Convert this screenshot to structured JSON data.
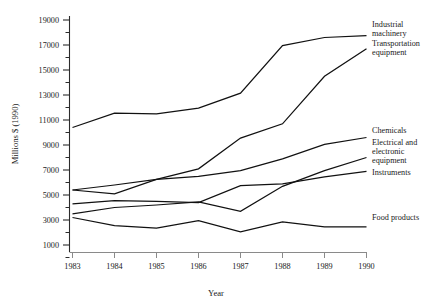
{
  "chart_data": {
    "type": "line",
    "title": "",
    "xlabel": "Year",
    "ylabel": "Millions $ (1990)",
    "x": [
      1983,
      1984,
      1985,
      1986,
      1987,
      1988,
      1989,
      1990
    ],
    "xtick_labels": [
      "1983",
      "1984",
      "1985",
      "1986",
      "1987",
      "1988",
      "1989",
      "1990"
    ],
    "ytick_labels": [
      "1000",
      "3000",
      "5000",
      "7000",
      "9000",
      "11000",
      "13000",
      "15000",
      "17000",
      "19000"
    ],
    "ytick_values": [
      1000,
      3000,
      5000,
      7000,
      9000,
      11000,
      13000,
      15000,
      17000,
      19000
    ],
    "ylim": [
      0,
      19800
    ],
    "xlim": [
      1983,
      1990
    ],
    "minor_ticks": true,
    "grid": false,
    "legend_position": "right-inline-labels",
    "series": [
      {
        "name": "Industrial machinery",
        "label": "Industrial machinery",
        "label_lines": [
          "Industrial",
          "machinery"
        ],
        "values": [
          10400,
          11550,
          11500,
          11950,
          13150,
          16950,
          17600,
          17750
        ]
      },
      {
        "name": "Transportation equipment",
        "label": "Transportation equipment",
        "label_lines": [
          "Transportation",
          "equipment"
        ],
        "values": [
          5400,
          5100,
          6250,
          7100,
          9550,
          10700,
          14500,
          16700
        ]
      },
      {
        "name": "Chemicals",
        "label": "Chemicals",
        "label_lines": [
          "Chemicals"
        ],
        "values": [
          5400,
          5800,
          6250,
          6500,
          6950,
          7900,
          9050,
          9600
        ]
      },
      {
        "name": "Electrical and electronic equipment",
        "label": "Electrical and electronic equipment",
        "label_lines": [
          "Electrical and",
          "electronic",
          "equipment"
        ],
        "values": [
          3500,
          4000,
          4200,
          4450,
          3700,
          5700,
          6950,
          8000
        ]
      },
      {
        "name": "Instruments",
        "label": "Instruments",
        "label_lines": [
          "Instruments"
        ],
        "values": [
          4300,
          4550,
          4500,
          4400,
          5750,
          5900,
          6450,
          6900
        ]
      },
      {
        "name": "Food products",
        "label": "Food products",
        "label_lines": [
          "Food products"
        ],
        "values": [
          3200,
          2550,
          2350,
          2950,
          2050,
          2850,
          2450,
          2450
        ]
      }
    ]
  },
  "labels": {
    "industrial_machinery_l1": "Industrial",
    "industrial_machinery_l2": "machinery",
    "transportation_l1": "Transportation",
    "transportation_l2": "equipment",
    "chemicals_l1": "Chemicals",
    "electrical_l1": "Electrical and",
    "electrical_l2": "electronic",
    "electrical_l3": "equipment",
    "instruments_l1": "Instruments",
    "food_products_l1": "Food products",
    "x_axis_title": "Year",
    "y_axis_title": "Millions $ (1990)"
  },
  "y_ticks": {
    "t0": "1000",
    "t1": "3000",
    "t2": "5000",
    "t3": "7000",
    "t4": "9000",
    "t5": "11000",
    "t6": "13000",
    "t7": "15000",
    "t8": "17000",
    "t9": "19000"
  },
  "x_ticks": {
    "t0": "1983",
    "t1": "1984",
    "t2": "1985",
    "t3": "1986",
    "t4": "1987",
    "t5": "1988",
    "t6": "1989",
    "t7": "1990"
  },
  "colors": {
    "line": "#111111",
    "axis": "#2b2b2b",
    "x_axis": "#8a8a8a",
    "text": "#1a1a1a",
    "background": "#ffffff"
  }
}
